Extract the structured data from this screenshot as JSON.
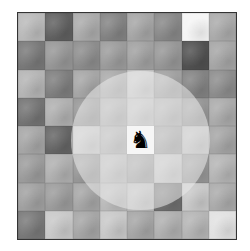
{
  "board": {
    "rows": 8,
    "cols": 8,
    "left": 17,
    "top": 12,
    "width": 220,
    "height": 228,
    "border_color": "#333333",
    "square_grays": [
      [
        185,
        95,
        170,
        130,
        165,
        135,
        245,
        170
      ],
      [
        120,
        150,
        140,
        155,
        160,
        150,
        80,
        165
      ],
      [
        180,
        125,
        165,
        170,
        200,
        160,
        130,
        140
      ],
      [
        115,
        175,
        150,
        175,
        195,
        175,
        150,
        170
      ],
      [
        165,
        100,
        200,
        175,
        240,
        160,
        190,
        165
      ],
      [
        155,
        175,
        150,
        185,
        160,
        195,
        150,
        180
      ],
      [
        160,
        155,
        165,
        185,
        190,
        110,
        200,
        170
      ],
      [
        120,
        200,
        165,
        200,
        165,
        175,
        180,
        225
      ]
    ]
  },
  "piece": {
    "type": "knight",
    "color": "black",
    "glyph": "♞",
    "row": 4,
    "col": 4
  },
  "highlight": {
    "shape": "circle",
    "center_row": 4,
    "center_col": 4,
    "radius_squares": 2.55,
    "color": "rgba(235,235,235,0.55)"
  }
}
